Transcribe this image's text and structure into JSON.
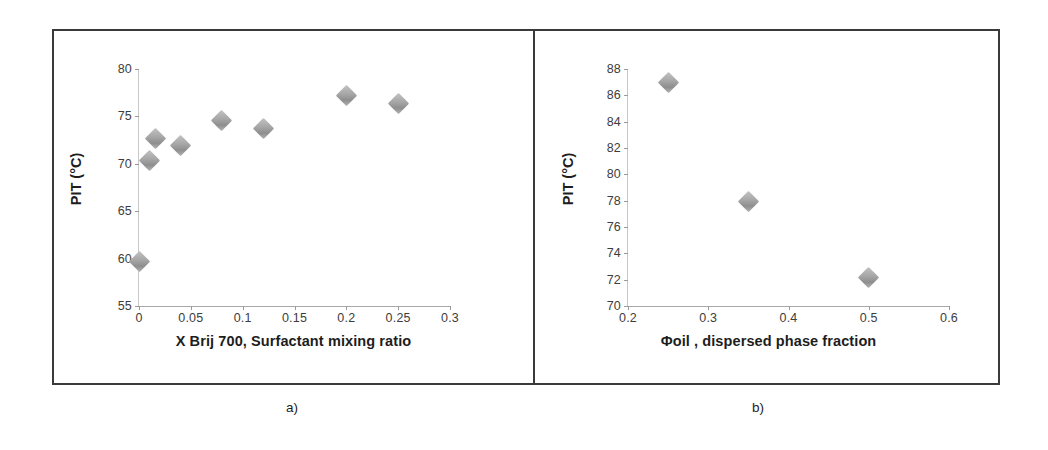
{
  "figure": {
    "panels": [
      {
        "id": "a",
        "caption": "a)",
        "chart": {
          "type": "scatter",
          "title": "",
          "xlabel": "X Brij 700, Surfactant mixing ratio",
          "ylabel": "PIT (°C)",
          "xlim": [
            0,
            0.3
          ],
          "ylim": [
            55,
            80
          ],
          "xticks": [
            0,
            0.05,
            0.1,
            0.15,
            0.2,
            0.25,
            0.3
          ],
          "xticklabels": [
            "0",
            "0.05",
            "0.1",
            "0.15",
            "0.2",
            "0.25",
            "0.3"
          ],
          "yticks": [
            55,
            60,
            65,
            70,
            75,
            80
          ],
          "yticklabels": [
            "55",
            "60",
            "65",
            "70",
            "75",
            "80"
          ],
          "grid": false,
          "legend": null,
          "marker": "diamond",
          "marker_color": "#a5a5a5",
          "points": [
            {
              "x": 0.0,
              "y": 59.7
            },
            {
              "x": 0.01,
              "y": 70.4
            },
            {
              "x": 0.016,
              "y": 72.7
            },
            {
              "x": 0.04,
              "y": 71.9
            },
            {
              "x": 0.08,
              "y": 74.6
            },
            {
              "x": 0.12,
              "y": 73.7
            },
            {
              "x": 0.2,
              "y": 77.2
            },
            {
              "x": 0.25,
              "y": 76.4
            }
          ]
        }
      },
      {
        "id": "b",
        "caption": "b)",
        "chart": {
          "type": "scatter",
          "title": "",
          "xlabel": "Φoil , dispersed phase fraction",
          "ylabel": "PIT (°C)",
          "xlim": [
            0.2,
            0.6
          ],
          "ylim": [
            70,
            88
          ],
          "xticks": [
            0.2,
            0.3,
            0.4,
            0.5,
            0.6
          ],
          "xticklabels": [
            "0.2",
            "0.3",
            "0.4",
            "0.5",
            "0.6"
          ],
          "yticks": [
            70,
            72,
            74,
            76,
            78,
            80,
            82,
            84,
            86,
            88
          ],
          "yticklabels": [
            "70",
            "72",
            "74",
            "76",
            "78",
            "80",
            "82",
            "84",
            "86",
            "88"
          ],
          "grid": false,
          "legend": null,
          "marker": "diamond",
          "marker_color": "#a5a5a5",
          "points": [
            {
              "x": 0.25,
              "y": 87.0
            },
            {
              "x": 0.35,
              "y": 77.9
            },
            {
              "x": 0.5,
              "y": 72.2
            }
          ]
        }
      }
    ],
    "colors": {
      "frame": "#3a3a3a",
      "axis": "#a8a8a8",
      "text": "#1d1d1d",
      "tick_text": "#3d3d3d",
      "marker": "#a5a5a5"
    }
  },
  "chart_data": [
    {
      "type": "scatter",
      "panel": "a)",
      "title": "",
      "xlabel": "X Brij 700, Surfactant mixing ratio",
      "ylabel": "PIT (°C)",
      "xlim": [
        0,
        0.3
      ],
      "ylim": [
        55,
        80
      ],
      "grid": false,
      "legend": null,
      "x": [
        0.0,
        0.01,
        0.016,
        0.04,
        0.08,
        0.12,
        0.2,
        0.25
      ],
      "values": [
        59.7,
        70.4,
        72.7,
        71.9,
        74.6,
        73.7,
        77.2,
        76.4
      ]
    },
    {
      "type": "scatter",
      "panel": "b)",
      "title": "",
      "xlabel": "Φoil , dispersed phase fraction",
      "ylabel": "PIT (°C)",
      "xlim": [
        0.2,
        0.6
      ],
      "ylim": [
        70,
        88
      ],
      "grid": false,
      "legend": null,
      "x": [
        0.25,
        0.35,
        0.5
      ],
      "values": [
        87.0,
        77.9,
        72.2
      ]
    }
  ]
}
